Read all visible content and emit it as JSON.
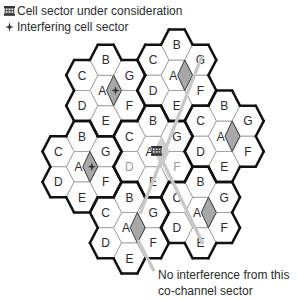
{
  "legend": {
    "items": [
      {
        "icon": "base-station-icon",
        "label": "Cell sector under consideration"
      },
      {
        "icon": "interferer-cross-icon",
        "label": "Interfering cell sector"
      }
    ]
  },
  "annotation": {
    "lines": [
      "No interference from this",
      "co-channel sector"
    ]
  },
  "diagram": {
    "grid": {
      "origin_x": 58.3,
      "origin_y": 60,
      "col_step": 23.7,
      "row_half_step": 15.25,
      "hex_radius": 15.8
    },
    "cell_offsets": {
      "A": [
        0,
        0
      ],
      "B": [
        0,
        -2
      ],
      "C": [
        -1,
        -1
      ],
      "G": [
        1,
        -1
      ],
      "D": [
        -1,
        1
      ],
      "F": [
        1,
        1
      ],
      "E": [
        0,
        2
      ]
    },
    "clusters": [
      {
        "id": "top-left",
        "center": [
          2,
          2
        ],
        "sector": "interfering"
      },
      {
        "id": "top-right",
        "center": [
          5,
          1
        ],
        "sector": "co-channel"
      },
      {
        "id": "left",
        "center": [
          1,
          7
        ],
        "sector": "interfering"
      },
      {
        "id": "center",
        "center": [
          4,
          6
        ],
        "sector": "serving",
        "dim_letters": [
          "D",
          "F"
        ]
      },
      {
        "id": "right",
        "center": [
          7,
          5
        ],
        "sector": "co-channel"
      },
      {
        "id": "bottom",
        "center": [
          3,
          11
        ],
        "sector": "co-channel"
      },
      {
        "id": "bottom-right",
        "center": [
          6,
          10
        ],
        "sector": "co-channel"
      }
    ],
    "paths": [
      {
        "name": "path-to-top-right-sector",
        "points": [
          [
            202,
            56
          ],
          [
            140,
            214
          ]
        ]
      },
      {
        "name": "path-to-bottom-right-cell",
        "points": [
          [
            161,
            158
          ],
          [
            203,
            244
          ]
        ]
      },
      {
        "name": "annotation-leader-line",
        "points": [
          [
            138,
            240
          ],
          [
            154,
            271
          ]
        ]
      }
    ],
    "style": {
      "thin_line": "#9d9d9d",
      "cluster_border": "#111111",
      "letter": "#2b2b2b",
      "dim_letter": "#9a9a9a",
      "sector_fill": "#a8a8a8",
      "sector_stroke": "#2a2a2a",
      "serving_sector": "#d0d0d0",
      "path_color": "#c8c8c8",
      "icon_color": "#333333"
    }
  }
}
